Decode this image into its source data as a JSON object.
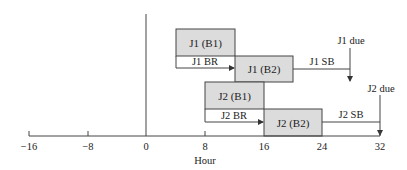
{
  "diagram": {
    "type": "timeline-gantt",
    "axis": {
      "label": "Hour",
      "ticks": [
        {
          "value": -16,
          "label": "−16"
        },
        {
          "value": -8,
          "label": "−8"
        },
        {
          "value": 0,
          "label": "0"
        },
        {
          "value": 8,
          "label": "8"
        },
        {
          "value": 16,
          "label": "16"
        },
        {
          "value": 24,
          "label": "24"
        },
        {
          "value": 32,
          "label": "32"
        }
      ],
      "range": [
        -16,
        32
      ]
    },
    "colors": {
      "box_fill": "#dcdcdc",
      "box_stroke": "#444444",
      "line": "#444444",
      "text": "#222222"
    },
    "boxes": [
      {
        "id": "j1b1",
        "label": "J1 (B1)",
        "start": 4,
        "end": 12,
        "row": 0
      },
      {
        "id": "j1b2",
        "label": "J1 (B2)",
        "start": 12,
        "end": 20,
        "row": 1
      },
      {
        "id": "j2b1",
        "label": "J2 (B1)",
        "start": 8,
        "end": 16,
        "row": 2
      },
      {
        "id": "j2b2",
        "label": "J2 (B2)",
        "start": 16,
        "end": 24,
        "row": 3
      }
    ],
    "arrows": {
      "j1_br": {
        "label": "J1 BR",
        "from": 4,
        "to": 12
      },
      "j1_sb": {
        "label": "J1 SB",
        "from": 20,
        "to": 28
      },
      "j2_br": {
        "label": "J2 BR",
        "from": 8,
        "to": 16
      },
      "j2_sb": {
        "label": "J2 SB",
        "from": 24,
        "to": 32
      }
    },
    "due": {
      "j1": {
        "label": "J1 due",
        "at": 28
      },
      "j2": {
        "label": "J2 due",
        "at": 32
      }
    }
  }
}
